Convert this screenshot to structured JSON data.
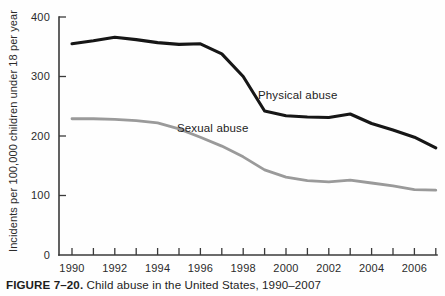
{
  "figure": {
    "caption_label": "FIGURE 7–20.",
    "caption_text": "Child abuse in the United States, 1990–2007"
  },
  "colors": {
    "physical_abuse": "#161616",
    "sexual_abuse": "#9a9a9a",
    "axis": "#3a3a3a",
    "text": "#2b2b2b",
    "background": "#fefefe"
  },
  "chart_data": {
    "type": "line",
    "title": "Child abuse in the United States, 1990–2007",
    "xlabel": "",
    "ylabel": "Incidents per 100,000 children under 18 per year",
    "xlim": [
      1990,
      2007
    ],
    "ylim": [
      0,
      400
    ],
    "ytick_labels": [
      "0",
      "100",
      "200",
      "300",
      "400"
    ],
    "yticks": [
      0,
      100,
      200,
      300,
      400
    ],
    "xtick_labels": [
      "1990",
      "1992",
      "1994",
      "1996",
      "1998",
      "2000",
      "2002",
      "2004",
      "2006"
    ],
    "xticks_major": [
      1990,
      1992,
      1994,
      1996,
      1998,
      2000,
      2002,
      2004,
      2006
    ],
    "xticks_all": [
      1990,
      1991,
      1992,
      1993,
      1994,
      1995,
      1996,
      1997,
      1998,
      1999,
      2000,
      2001,
      2002,
      2003,
      2004,
      2005,
      2006,
      2007
    ],
    "grid": false,
    "legend_position": "inline-annotations",
    "x": [
      1990,
      1991,
      1992,
      1993,
      1994,
      1995,
      1996,
      1997,
      1998,
      1999,
      2000,
      2001,
      2002,
      2003,
      2004,
      2005,
      2006,
      2007
    ],
    "series": [
      {
        "name": "Physical abuse",
        "color": "#161616",
        "label_x": 2001,
        "label_y": 275,
        "values": [
          355,
          360,
          366,
          362,
          357,
          354,
          355,
          338,
          300,
          242,
          234,
          232,
          231,
          237,
          221,
          210,
          198,
          180
        ]
      },
      {
        "name": "Sexual abuse",
        "color": "#9a9a9a",
        "label_x": 1995,
        "label_y": 222,
        "values": [
          229,
          229,
          228,
          226,
          222,
          212,
          198,
          183,
          165,
          143,
          131,
          125,
          123,
          126,
          121,
          116,
          110,
          109
        ]
      }
    ],
    "annotations": [
      {
        "text": "Physical abuse",
        "x": 2000,
        "y": 267
      },
      {
        "text": "Sexual abuse",
        "x": 1995,
        "y": 214
      }
    ]
  }
}
